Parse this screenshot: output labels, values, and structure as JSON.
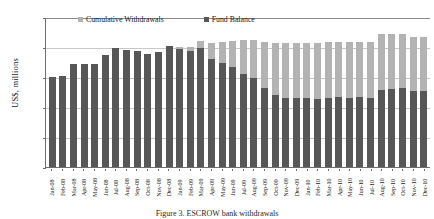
{
  "chart_data": {
    "type": "bar",
    "title": "",
    "subtitle": "",
    "stacked": true,
    "xlabel": "",
    "ylabel": "US$, millions",
    "ylim": [
      0,
      25000
    ],
    "ytick_values": [
      0,
      5000,
      10000,
      15000,
      20000,
      25000
    ],
    "ytick_labels": [
      "0",
      "5,000",
      "10,000",
      "15,000",
      "20,000",
      "25,000"
    ],
    "grid": true,
    "legend_position": "top-inside",
    "categories": [
      "Jan-08",
      "Feb-08",
      "Mar-08",
      "Apr-08",
      "May-08",
      "Jun-08",
      "Jul-08",
      "Aug-08",
      "Sep-08",
      "Oct-08",
      "Nov-08",
      "Dec-08",
      "Jan-09",
      "Feb-09",
      "Mar-09",
      "Apr-09",
      "May-09",
      "Jun-09",
      "Jul-09",
      "Aug-09",
      "Sep-09",
      "Oct-09",
      "Nov-09",
      "Dec-09",
      "Jan-10",
      "Feb-10",
      "Mar-10",
      "Apr-10",
      "May-10",
      "Jun-10",
      "Jul-10",
      "Aug-10",
      "Sep-10",
      "Oct-10",
      "Nov-10",
      "Dec-10"
    ],
    "series": [
      {
        "name": "Fund Balance",
        "color": "#575757",
        "values": [
          14950,
          15250,
          17150,
          17150,
          17100,
          18750,
          19850,
          19450,
          19400,
          18800,
          19200,
          20250,
          19650,
          19400,
          19900,
          18050,
          17300,
          16700,
          15450,
          14800,
          13200,
          12000,
          11500,
          11450,
          11450,
          11350,
          11550,
          11600,
          11500,
          11600,
          11550,
          12900,
          12950,
          13150,
          12600,
          12650
        ]
      },
      {
        "name": "Cumulative Withdrawals",
        "color": "#b3b3b3",
        "values": [
          0,
          0,
          0,
          0,
          0,
          0,
          0,
          0,
          0,
          0,
          0,
          0,
          350,
          600,
          1100,
          2600,
          3500,
          4350,
          5700,
          6350,
          7700,
          8700,
          9200,
          9250,
          9300,
          9400,
          9250,
          9200,
          9300,
          9200,
          9250,
          9250,
          9250,
          9100,
          9000,
          8950
        ]
      }
    ],
    "legend": [
      "Cumulative Withdrawals",
      "Fund Balance"
    ]
  },
  "caption": "Figure 3. ESCROW bank withdrawals"
}
